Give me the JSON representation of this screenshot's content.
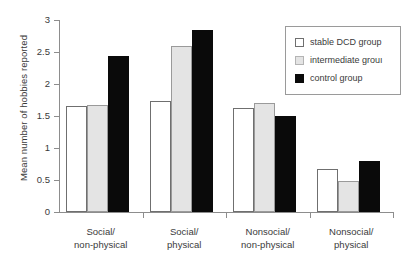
{
  "chart_data": {
    "type": "bar",
    "title": "",
    "xlabel": "",
    "ylabel": "Mean number of hobbies reported",
    "ylim": [
      0,
      3
    ],
    "ytick_labels": [
      "0",
      "0.5",
      "1",
      "1.5",
      "2",
      "2.5",
      "3"
    ],
    "ytick_values": [
      0,
      0.5,
      1,
      1.5,
      2,
      2.5,
      3
    ],
    "grid": false,
    "legend_position": "top-right",
    "categories": [
      "Social/\nnon-physical",
      "Social/\nphysical",
      "Nonsocial/\nnon-physical",
      "Nonsocial/\nphysical"
    ],
    "category_lines": [
      [
        "Social/",
        "non-physical"
      ],
      [
        "Social/",
        "physical"
      ],
      [
        "Nonsocial/",
        "non-physical"
      ],
      [
        "Nonsocial/",
        "physical"
      ]
    ],
    "series": [
      {
        "name": "stable DCD group",
        "color": "#ffffff",
        "edge_color": "#6f6f6f",
        "values": [
          1.66,
          1.74,
          1.62,
          0.67
        ]
      },
      {
        "name": "intermediate group",
        "color": "#e4e4e4",
        "edge_color": "#9a9a9a",
        "values": [
          1.67,
          2.6,
          1.7,
          0.49
        ]
      },
      {
        "name": "control group",
        "color": "#0a0a0a",
        "edge_color": "#0a0a0a",
        "values": [
          2.43,
          2.85,
          1.5,
          0.8
        ]
      }
    ]
  },
  "legend": {
    "entries": [
      {
        "label": "stable DCD group",
        "swatch": "white"
      },
      {
        "label": "intermediate grouı",
        "swatch": "gray"
      },
      {
        "label": "control group",
        "swatch": "black"
      }
    ]
  }
}
